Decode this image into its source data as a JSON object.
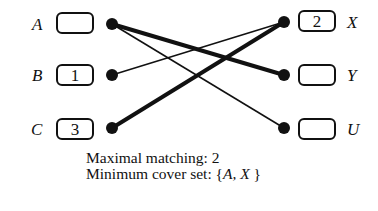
{
  "left_nodes": [
    {
      "label": "A",
      "value": ""
    },
    {
      "label": "B",
      "value": "1"
    },
    {
      "label": "C",
      "value": "3"
    }
  ],
  "right_nodes": [
    {
      "label": "X",
      "value": "2"
    },
    {
      "label": "Y",
      "value": ""
    },
    {
      "label": "U",
      "value": ""
    }
  ],
  "edges": [
    {
      "from": "A",
      "to": "Y",
      "matched": true
    },
    {
      "from": "A",
      "to": "U",
      "matched": false
    },
    {
      "from": "B",
      "to": "X",
      "matched": false
    },
    {
      "from": "C",
      "to": "X",
      "matched": true
    }
  ],
  "caption": {
    "line1": "Maximal matching: 2",
    "line2_prefix": "Minimum cover set: {",
    "line2_set": "A, X",
    "line2_suffix": " }"
  }
}
